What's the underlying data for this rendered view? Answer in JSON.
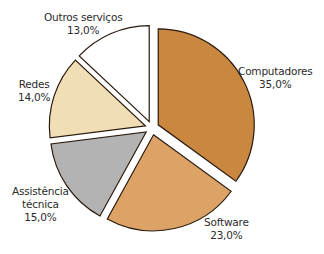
{
  "chart_data": {
    "type": "pie",
    "title": "",
    "exploded": true,
    "start_angle_deg": -90,
    "direction": "clockwise",
    "slices": [
      {
        "label": "Computadores",
        "value": 35.0,
        "value_label": "35,0%",
        "color": "#c9873f"
      },
      {
        "label": "Software",
        "value": 23.0,
        "value_label": "23,0%",
        "color": "#dca266"
      },
      {
        "label": "Assistência técnica",
        "value": 15.0,
        "value_label": "15,0%",
        "color": "#b3b3b3"
      },
      {
        "label": "Redes",
        "value": 14.0,
        "value_label": "14,0%",
        "color": "#f1deb5"
      },
      {
        "label": "Outros serviços",
        "value": 13.0,
        "value_label": "13,0%",
        "color": "#ffffff"
      }
    ],
    "legend": "none (labels placed beside slices)"
  },
  "labels": {
    "computadores": {
      "line1": "Computadores",
      "line2": "35,0%"
    },
    "software": {
      "line1": "Software",
      "line2": "23,0%"
    },
    "assistencia": {
      "line1": "Assistência",
      "line2": "técnica",
      "line3": "15,0%"
    },
    "redes": {
      "line1": "Redes",
      "line2": "14,0%"
    },
    "outros": {
      "line1": "Outros serviços",
      "line2": "13,0%"
    }
  }
}
